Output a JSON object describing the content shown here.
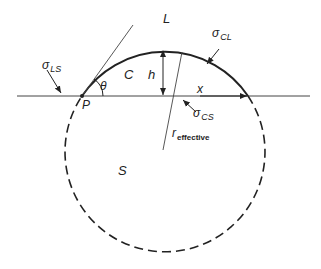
{
  "diagram": {
    "title": "",
    "regions": {
      "liquid": "L",
      "crystal": "C",
      "substrate": "S"
    },
    "labels": {
      "sigma_LS": {
        "main": "σ",
        "sub": "LS"
      },
      "sigma_CL": {
        "main": "σ",
        "sub": "CL"
      },
      "sigma_CS": {
        "main": "σ",
        "sub": "CS"
      },
      "contact_point": "P",
      "angle": "θ",
      "height": "h",
      "half_width": "x",
      "radius": {
        "main": "r",
        "sub": "effective"
      }
    },
    "colors": {
      "line": "#222222",
      "background": "#ffffff"
    }
  }
}
